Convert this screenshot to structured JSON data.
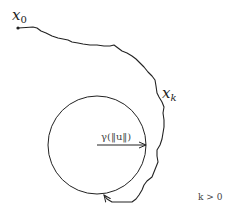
{
  "diagram": {
    "start_label": "x",
    "start_sub": "0",
    "traj_label": "x",
    "traj_sub": "k",
    "radius_label": "γ(‖u‖)",
    "condition_label": "k > 0",
    "colors": {
      "stroke": "#222222",
      "background": "#ffffff"
    },
    "circle": {
      "cx": 97,
      "cy": 145,
      "r": 49
    }
  }
}
